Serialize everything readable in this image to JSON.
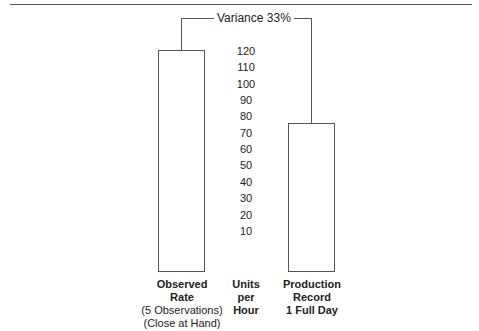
{
  "chart_data": {
    "type": "bar",
    "title": "",
    "annotation": "Variance 33%",
    "categories": [
      "Observed Rate (5 Observations) (Close at Hand)",
      "Production Record 1 Full Day"
    ],
    "values": [
      120,
      75
    ],
    "ylabel": "Units per Hour",
    "yticks": [
      10,
      20,
      30,
      40,
      50,
      60,
      70,
      80,
      90,
      100,
      110,
      120
    ],
    "ylim": [
      0,
      120
    ],
    "grid": false
  },
  "labels": {
    "variance": "Variance 33%",
    "left_l1": "Observed",
    "left_l2": "Rate",
    "left_l3": "(5 Observations)",
    "left_l4": "(Close at Hand)",
    "mid_l1": "Units",
    "mid_l2": "per",
    "mid_l3": "Hour",
    "right_l1": "Production",
    "right_l2": "Record",
    "right_l3": "1 Full Day"
  },
  "ticks": [
    "120",
    "110",
    "100",
    "90",
    "80",
    "70",
    "60",
    "50",
    "40",
    "30",
    "20",
    "10"
  ]
}
